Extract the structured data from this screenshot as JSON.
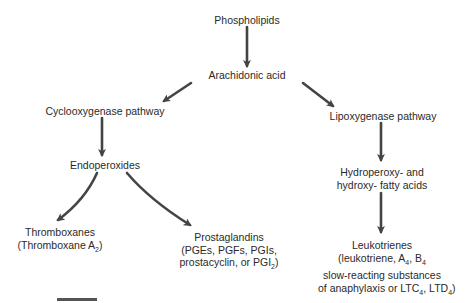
{
  "diagram": {
    "type": "flowchart",
    "nodes": {
      "phospholipids": {
        "label": "Phospholipids"
      },
      "arachidonic_acid": {
        "label": "Arachidonic acid"
      },
      "cyclooxygenase": {
        "label": "Cyclooxygenase pathway"
      },
      "lipoxygenase": {
        "label": "Lipoxygenase pathway"
      },
      "endoperoxides": {
        "label": "Endoperoxides"
      },
      "hydroperoxy": {
        "lines": [
          "Hydroperoxy- and",
          "hydroxy- fatty acids"
        ]
      },
      "thromboxanes": {
        "lines": [
          "Thromboxanes",
          "(Thromboxane A",
          "2",
          ")"
        ]
      },
      "prostaglandins": {
        "lines": [
          "Prostaglandins",
          "(PGEs, PGFs, PGIs,",
          "prostacyclin, or PGI",
          "2",
          ")"
        ]
      },
      "leukotrienes": {
        "lines": [
          "Leukotrienes",
          "(leukotriene, A",
          "4",
          ", B",
          "4",
          "slow-reacting substances",
          "of anaphylaxis or LTC",
          "4",
          ", LTD",
          "4",
          ")"
        ]
      }
    },
    "edges": [
      {
        "from": "Phospholipids",
        "to": "Arachidonic acid"
      },
      {
        "from": "Arachidonic acid",
        "to": "Cyclooxygenase pathway"
      },
      {
        "from": "Arachidonic acid",
        "to": "Lipoxygenase pathway"
      },
      {
        "from": "Cyclooxygenase pathway",
        "to": "Endoperoxides"
      },
      {
        "from": "Endoperoxides",
        "to": "Thromboxanes"
      },
      {
        "from": "Endoperoxides",
        "to": "Prostaglandins"
      },
      {
        "from": "Lipoxygenase pathway",
        "to": "Hydroperoxy- and hydroxy- fatty acids"
      },
      {
        "from": "Hydroperoxy- and hydroxy- fatty acids",
        "to": "Leukotrienes"
      }
    ],
    "colors": {
      "text": "#2a2a2a",
      "arrow": "#444444",
      "background": "#ffffff"
    }
  }
}
